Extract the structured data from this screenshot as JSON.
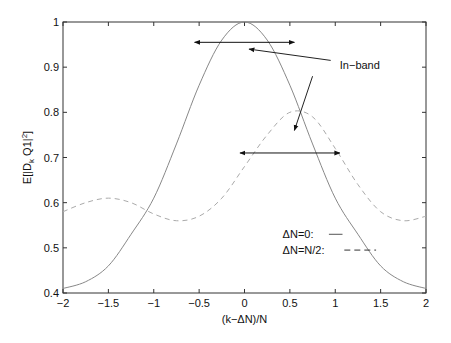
{
  "chart_data": {
    "type": "line",
    "title": "",
    "xlabel": "(k−ΔN)/N",
    "ylabel": "E[|D_k Q1|^2]",
    "xlim": [
      -2,
      2
    ],
    "ylim": [
      0.4,
      1
    ],
    "xticks": [
      -2,
      -1.5,
      -1,
      -0.5,
      0,
      0.5,
      1,
      1.5,
      2
    ],
    "xtick_labels": [
      "−2",
      "−1.5",
      "−1",
      "−0.5",
      "0",
      "0.5",
      "1",
      "1.5",
      "2"
    ],
    "yticks": [
      0.4,
      0.5,
      0.6,
      0.7,
      0.8,
      0.9,
      1
    ],
    "ytick_labels": [
      "0.4",
      "0.5",
      "0.6",
      "0.7",
      "0.8",
      "0.9",
      "1"
    ],
    "grid": false,
    "x": [
      -2,
      -1.75,
      -1.5,
      -1.25,
      -1,
      -0.75,
      -0.5,
      -0.25,
      0,
      0.25,
      0.5,
      0.75,
      1,
      1.25,
      1.5,
      1.75,
      2
    ],
    "series": [
      {
        "name": "ΔN=0",
        "style": "solid",
        "values": [
          0.41,
          0.425,
          0.46,
          0.53,
          0.61,
          0.73,
          0.86,
          0.96,
          1.0,
          0.96,
          0.86,
          0.73,
          0.61,
          0.53,
          0.46,
          0.425,
          0.41
        ]
      },
      {
        "name": "ΔN=N/2",
        "style": "dashed",
        "values": [
          0.58,
          0.6,
          0.61,
          0.6,
          0.575,
          0.56,
          0.57,
          0.61,
          0.68,
          0.75,
          0.8,
          0.79,
          0.72,
          0.64,
          0.58,
          0.56,
          0.57
        ]
      }
    ],
    "legend": {
      "position": "lower right",
      "entries": [
        "ΔN=0:",
        "ΔN=N/2:"
      ]
    },
    "annotations": [
      {
        "text": "In−band",
        "type": "label",
        "x": 1.05,
        "y": 0.905
      },
      {
        "type": "double-arrow",
        "x0": -0.55,
        "x1": 0.55,
        "y": 0.955
      },
      {
        "type": "double-arrow",
        "x0": -0.05,
        "x1": 1.05,
        "y": 0.71
      },
      {
        "type": "arrow",
        "from": [
          0.95,
          0.915
        ],
        "to": [
          0.05,
          0.94
        ]
      },
      {
        "type": "arrow",
        "from": [
          0.75,
          0.88
        ],
        "to": [
          0.55,
          0.76
        ]
      }
    ]
  }
}
